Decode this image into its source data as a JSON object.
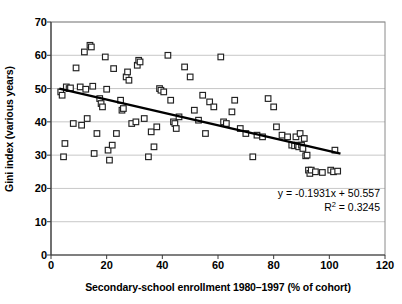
{
  "chart_data": {
    "type": "scatter",
    "title": "",
    "xlabel": "Secondary-school enrollment 1980–1997 (% of cohort)",
    "ylabel": "Gini index (various years)",
    "xlim": [
      0,
      120
    ],
    "ylim": [
      0,
      70
    ],
    "xticks": [
      0,
      20,
      40,
      60,
      80,
      100,
      120
    ],
    "yticks": [
      0,
      10,
      20,
      30,
      40,
      50,
      60,
      70
    ],
    "grid": "horizontal",
    "legend": "none",
    "marker": "open-square",
    "marker_color": "#222222",
    "marker_fill": "#ffffff",
    "trendline": {
      "type": "linear",
      "slope": -0.1931,
      "intercept": 50.557,
      "r_squared": 0.3245,
      "equation_text": "y = -0.1931x + 50.557",
      "r2_text_prefix": "R",
      "r2_text_sup": "2",
      "r2_text_value": " = 0.3245",
      "color": "#000000",
      "x_start": 3,
      "x_end": 104
    },
    "points": [
      [
        3.5,
        49.0
      ],
      [
        4.0,
        48.0
      ],
      [
        4.5,
        29.5
      ],
      [
        5.0,
        33.5
      ],
      [
        5.5,
        50.5
      ],
      [
        6.5,
        50.0
      ],
      [
        7.0,
        50.2
      ],
      [
        8.0,
        39.5
      ],
      [
        9.0,
        56.2
      ],
      [
        10.5,
        50.5
      ],
      [
        11.0,
        39.0
      ],
      [
        12.0,
        61.0
      ],
      [
        12.5,
        49.8
      ],
      [
        13.0,
        41.0
      ],
      [
        14.0,
        63.0
      ],
      [
        14.5,
        62.5
      ],
      [
        15.0,
        50.7
      ],
      [
        15.5,
        30.5
      ],
      [
        16.5,
        36.5
      ],
      [
        17.5,
        47.0
      ],
      [
        18.0,
        45.5
      ],
      [
        18.5,
        44.5
      ],
      [
        19.5,
        59.5
      ],
      [
        20.0,
        49.8
      ],
      [
        20.5,
        31.5
      ],
      [
        21.0,
        28.5
      ],
      [
        22.0,
        33.0
      ],
      [
        22.5,
        56.0
      ],
      [
        23.5,
        36.5
      ],
      [
        25.0,
        46.5
      ],
      [
        25.5,
        43.5
      ],
      [
        26.0,
        44.0
      ],
      [
        27.0,
        53.5
      ],
      [
        27.5,
        55.0
      ],
      [
        28.0,
        52.5
      ],
      [
        29.0,
        39.5
      ],
      [
        30.5,
        40.0
      ],
      [
        31.0,
        57.0
      ],
      [
        31.5,
        58.5
      ],
      [
        32.0,
        58.0
      ],
      [
        33.5,
        41.0
      ],
      [
        35.0,
        29.5
      ],
      [
        36.0,
        37.0
      ],
      [
        37.0,
        32.5
      ],
      [
        38.0,
        38.5
      ],
      [
        39.0,
        50.0
      ],
      [
        39.5,
        49.5
      ],
      [
        40.5,
        49.0
      ],
      [
        42.0,
        60.0
      ],
      [
        43.0,
        46.5
      ],
      [
        44.0,
        40.0
      ],
      [
        44.5,
        39.5
      ],
      [
        45.0,
        38.0
      ],
      [
        46.0,
        41.5
      ],
      [
        48.0,
        56.5
      ],
      [
        50.0,
        53.5
      ],
      [
        51.5,
        43.5
      ],
      [
        53.0,
        40.5
      ],
      [
        54.5,
        48.0
      ],
      [
        55.5,
        36.5
      ],
      [
        57.0,
        46.0
      ],
      [
        58.5,
        44.5
      ],
      [
        61.0,
        59.5
      ],
      [
        62.0,
        40.0
      ],
      [
        63.0,
        39.5
      ],
      [
        65.0,
        43.0
      ],
      [
        66.0,
        46.5
      ],
      [
        68.0,
        38.0
      ],
      [
        70.0,
        36.5
      ],
      [
        72.5,
        29.5
      ],
      [
        74.0,
        36.0
      ],
      [
        76.0,
        35.5
      ],
      [
        78.0,
        47.0
      ],
      [
        80.0,
        44.5
      ],
      [
        81.0,
        38.5
      ],
      [
        83.0,
        36.0
      ],
      [
        85.0,
        35.5
      ],
      [
        86.5,
        33.0
      ],
      [
        87.5,
        32.8
      ],
      [
        88.0,
        35.5
      ],
      [
        88.5,
        33.0
      ],
      [
        89.0,
        32.5
      ],
      [
        89.5,
        36.5
      ],
      [
        90.0,
        33.0
      ],
      [
        90.5,
        32.0
      ],
      [
        91.0,
        35.0
      ],
      [
        91.5,
        29.8
      ],
      [
        92.0,
        30.0
      ],
      [
        92.5,
        25.5
      ],
      [
        93.0,
        24.5
      ],
      [
        93.5,
        25.5
      ],
      [
        95.0,
        25.0
      ],
      [
        97.5,
        24.8
      ],
      [
        100.5,
        25.5
      ],
      [
        101.5,
        25.0
      ],
      [
        102.0,
        31.5
      ],
      [
        103.0,
        25.2
      ]
    ]
  },
  "ytick_labels": [
    "0",
    "10",
    "20",
    "30",
    "40",
    "50",
    "60",
    "70"
  ],
  "xtick_labels": [
    "0",
    "20",
    "40",
    "60",
    "80",
    "100",
    "120"
  ]
}
